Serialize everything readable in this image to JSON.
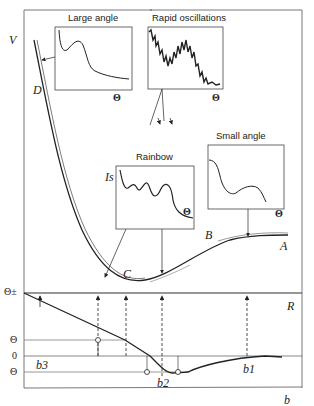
{
  "axes": {
    "top_y_label": "V",
    "bottom_x_label": "b",
    "bottom_right_label": "R",
    "theta_pm_label": "Θ±",
    "theta_label": "Θ",
    "zero_label": "0",
    "theta_neg_label": "Θ"
  },
  "curve_labels": {
    "A": "A",
    "B": "B",
    "C": "C",
    "D": "D"
  },
  "impact_parameters": [
    "b3",
    "b2",
    "b1"
  ],
  "insets": [
    {
      "title": "Large angle",
      "x_label": "Θ",
      "y_label": ""
    },
    {
      "title": "Rapid oscillations",
      "x_label": "Θ",
      "y_label": ""
    },
    {
      "title": "Rainbow",
      "x_label": "Θ",
      "y_label": "Is"
    },
    {
      "title": "Small angle",
      "x_label": "Θ",
      "y_label": ""
    }
  ],
  "colors": {
    "line": "#222222",
    "frame": "#555555",
    "background": "#ffffff"
  }
}
